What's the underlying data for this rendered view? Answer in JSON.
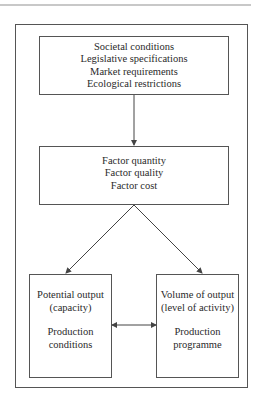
{
  "diagram": {
    "top_box": {
      "lines": [
        "Societal conditions",
        "Legislative specifications",
        "Market requirements",
        "Ecological restrictions"
      ]
    },
    "middle_box": {
      "lines": [
        "Factor quantity",
        "Factor quality",
        "Factor cost"
      ]
    },
    "left_box": {
      "title_lines": [
        "Potential output",
        "(capacity)"
      ],
      "sub_lines": [
        "Production",
        "conditions"
      ]
    },
    "right_box": {
      "title_lines": [
        "Volume of output",
        "(level of activity)"
      ],
      "sub_lines": [
        "Production",
        "programme"
      ]
    },
    "connections": [
      {
        "from": "top_box",
        "to": "middle_box",
        "type": "arrow"
      },
      {
        "from": "middle_box",
        "to": "left_box",
        "type": "arrow"
      },
      {
        "from": "middle_box",
        "to": "right_box",
        "type": "arrow"
      },
      {
        "from": "left_box",
        "to": "right_box",
        "type": "double-arrow"
      }
    ],
    "colors": {
      "line": "#555555",
      "text": "#2a2a2a",
      "rule": "#c8c8c8"
    }
  }
}
